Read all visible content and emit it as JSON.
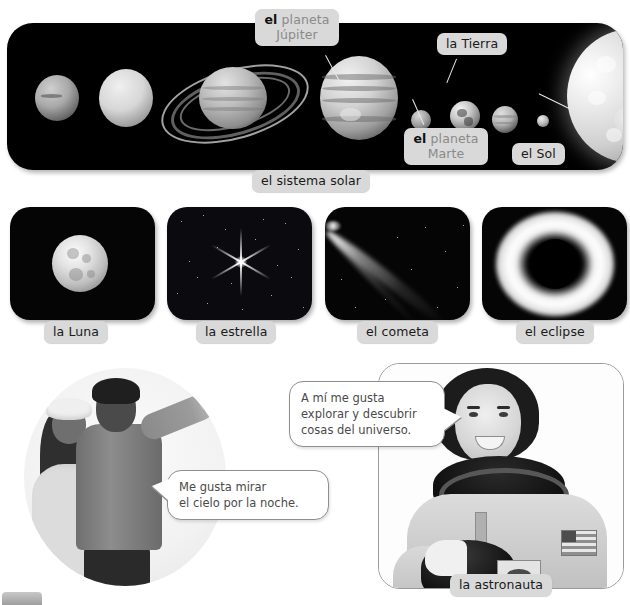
{
  "solar_system": {
    "caption": "el sistema solar",
    "labels": [
      {
        "id": "jupiter",
        "article": "el",
        "noun": "planeta Júpiter",
        "line1": "el planeta",
        "line2": "Júpiter",
        "style": "split"
      },
      {
        "id": "tierra",
        "text": "la Tierra",
        "style": "plain"
      },
      {
        "id": "marte",
        "article": "el",
        "noun": "planeta Marte",
        "line1": "el planeta",
        "line2": "Marte",
        "style": "split"
      },
      {
        "id": "sol",
        "text": "el Sol",
        "style": "plain"
      }
    ],
    "bodies": [
      {
        "name": "Neptuno",
        "order": 1
      },
      {
        "name": "Urano",
        "order": 2
      },
      {
        "name": "Saturno",
        "order": 3
      },
      {
        "name": "Júpiter",
        "order": 4
      },
      {
        "name": "Marte",
        "order": 5
      },
      {
        "name": "Tierra",
        "order": 6
      },
      {
        "name": "Venus",
        "order": 7
      },
      {
        "name": "Mercurio",
        "order": 8
      },
      {
        "name": "Sol",
        "order": 9
      }
    ]
  },
  "tiles": [
    {
      "id": "luna",
      "label": "la Luna",
      "icon": "moon-icon"
    },
    {
      "id": "estrella",
      "label": "la estrella",
      "icon": "star-icon"
    },
    {
      "id": "cometa",
      "label": "el cometa",
      "icon": "comet-icon"
    },
    {
      "id": "eclipse",
      "label": "el eclipse",
      "icon": "eclipse-icon"
    }
  ],
  "bottom": {
    "kids_quote_line1": "Me gusta mirar",
    "kids_quote_line2": "el cielo por la noche.",
    "astronaut_quote_line1": "A mí me gusta",
    "astronaut_quote_line2": "explorar y descubrir",
    "astronaut_quote_line3": "cosas del universo.",
    "astronaut_label": "la astronauta"
  },
  "colors": {
    "chip_bg": "#d9d9d9",
    "chip_text": "#1a1a1a",
    "chip_dim_text": "#8a8a8a",
    "panel_bg": "#000000",
    "bubble_border": "#8e8e8e",
    "bubble_text": "#4a4a4a",
    "page_bg": "#ffffff"
  }
}
